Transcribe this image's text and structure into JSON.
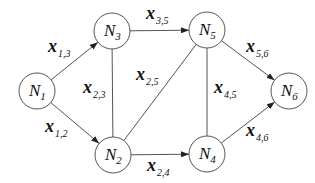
{
  "diagram": {
    "type": "network-flow-graph",
    "nodes": [
      {
        "id": "N1",
        "letter": "N",
        "sub": "1",
        "cx": 37,
        "cy": 91,
        "r": 18
      },
      {
        "id": "N2",
        "letter": "N",
        "sub": "2",
        "cx": 113,
        "cy": 155,
        "r": 18
      },
      {
        "id": "N3",
        "letter": "N",
        "sub": "3",
        "cx": 112,
        "cy": 31,
        "r": 18
      },
      {
        "id": "N4",
        "letter": "N",
        "sub": "4",
        "cx": 207,
        "cy": 154,
        "r": 18
      },
      {
        "id": "N5",
        "letter": "N",
        "sub": "5",
        "cx": 207,
        "cy": 30,
        "r": 18
      },
      {
        "id": "N6",
        "letter": "N",
        "sub": "6",
        "cx": 289,
        "cy": 91,
        "r": 18
      }
    ],
    "edges": [
      {
        "id": "e13",
        "from": "N1",
        "to": "N3",
        "directed": true,
        "var": "x",
        "sub": "1,3",
        "lx": 48,
        "ly": 52
      },
      {
        "id": "e12",
        "from": "N1",
        "to": "N2",
        "directed": true,
        "var": "x",
        "sub": "1,2",
        "lx": 45,
        "ly": 132
      },
      {
        "id": "e23",
        "from": "N2",
        "to": "N3",
        "directed": false,
        "var": "x",
        "sub": "2,3",
        "lx": 83,
        "ly": 93
      },
      {
        "id": "e35",
        "from": "N3",
        "to": "N5",
        "directed": true,
        "var": "x",
        "sub": "3,5",
        "lx": 146,
        "ly": 19
      },
      {
        "id": "e25",
        "from": "N2",
        "to": "N5",
        "directed": false,
        "var": "x",
        "sub": "2,5",
        "lx": 136,
        "ly": 80
      },
      {
        "id": "e24",
        "from": "N2",
        "to": "N4",
        "directed": true,
        "var": "x",
        "sub": "2,4",
        "lx": 147,
        "ly": 171
      },
      {
        "id": "e45",
        "from": "N4",
        "to": "N5",
        "directed": false,
        "var": "x",
        "sub": "4,5",
        "lx": 214,
        "ly": 93
      },
      {
        "id": "e56",
        "from": "N5",
        "to": "N6",
        "directed": true,
        "var": "x",
        "sub": "5,6",
        "lx": 246,
        "ly": 52
      },
      {
        "id": "e46",
        "from": "N4",
        "to": "N6",
        "directed": true,
        "var": "x",
        "sub": "4,6",
        "lx": 246,
        "ly": 136
      }
    ],
    "colors": {
      "stroke": "#555555",
      "text": "#111111",
      "background": "#ffffff"
    }
  }
}
